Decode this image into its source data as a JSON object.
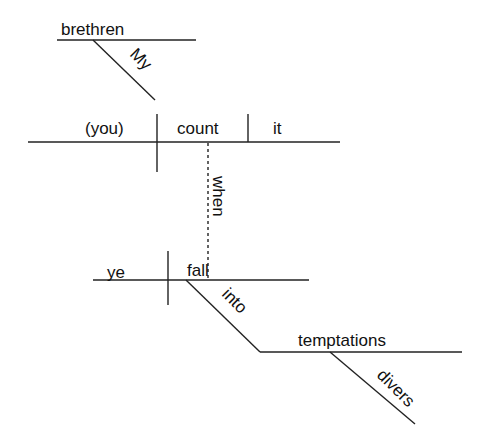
{
  "diagram": {
    "type": "Reed-Kellogg sentence diagram",
    "colors": {
      "line": "#222222",
      "text": "#111111",
      "background": "#ffffff"
    },
    "words": {
      "brethren": "brethren",
      "my": "My",
      "subject": "(you)",
      "verb": "count",
      "object": "it",
      "conjunction": "when",
      "sub_subject": "ye",
      "sub_verb": "fall",
      "preposition": "into",
      "prep_object": "temptations",
      "modifier": "divers"
    }
  }
}
